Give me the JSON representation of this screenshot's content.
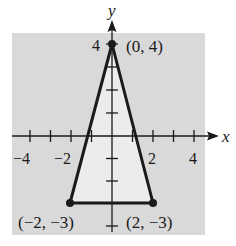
{
  "diagram": {
    "type": "coordinate-plane-triangle",
    "axes": {
      "x_label": "x",
      "y_label": "y",
      "x_range": [
        -4.5,
        4.5
      ],
      "y_range": [
        -4,
        5
      ],
      "x_tick_labels": [
        {
          "value": -4,
          "text": "−4"
        },
        {
          "value": -2,
          "text": "−2"
        },
        {
          "value": 2,
          "text": "2"
        },
        {
          "value": 4,
          "text": "4"
        }
      ],
      "y_tick_labels": [
        {
          "value": 4,
          "text": "4"
        }
      ]
    },
    "vertices": [
      {
        "x": 0,
        "y": 4,
        "label": "(0, 4)"
      },
      {
        "x": -2,
        "y": -3,
        "label": "(−2, −3)"
      },
      {
        "x": 2,
        "y": -3,
        "label": "(2, −3)"
      }
    ],
    "colors": {
      "background_region": "#d9d9d9",
      "triangle_fill": "#ececec",
      "stroke": "#1a1a1a"
    }
  }
}
